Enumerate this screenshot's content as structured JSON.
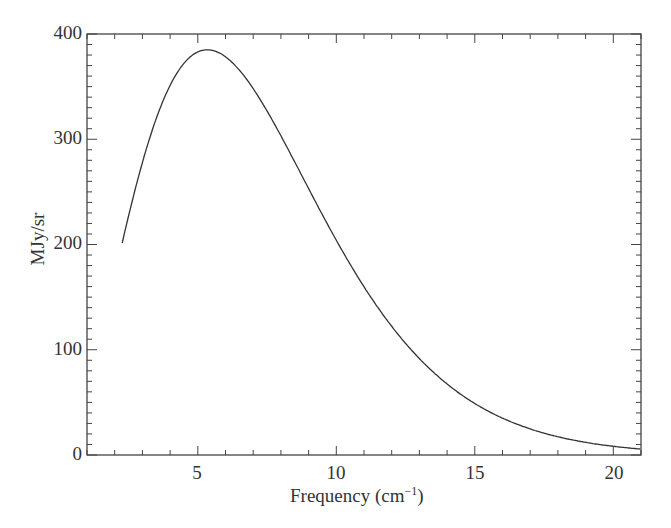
{
  "chart_data": {
    "type": "line",
    "title": "",
    "xlabel": "Frequency (cm⁻¹)",
    "ylabel": "MJy/sr",
    "xlim": [
      1,
      21
    ],
    "ylim": [
      0,
      400
    ],
    "xticks": [
      5,
      10,
      15,
      20
    ],
    "yticks": [
      0,
      100,
      200,
      300,
      400
    ],
    "x_minor_step": 1,
    "y_minor_step": 10,
    "grid": false,
    "legend": null,
    "series": [
      {
        "name": "CMB blackbody spectrum",
        "color": "#333333",
        "x": [
          2.27,
          3,
          4,
          5,
          5.34,
          6,
          7,
          8,
          9,
          10,
          11,
          12,
          13,
          14,
          15,
          16,
          17,
          18,
          19,
          20,
          21
        ],
        "y": [
          201,
          278,
          351,
          383,
          385,
          379,
          348,
          304,
          253,
          204,
          160,
          122,
          92,
          68,
          49,
          35,
          25,
          17,
          12,
          8.3,
          5.6
        ]
      }
    ]
  },
  "labels": {
    "xlabel_main": "Frequency (cm",
    "xlabel_sup": "−1",
    "xlabel_close": ")",
    "ylabel": "MJy/sr",
    "yticks": [
      "400",
      "300",
      "200",
      "100",
      "0"
    ],
    "xticks": [
      "5",
      "10",
      "15",
      "20"
    ]
  }
}
